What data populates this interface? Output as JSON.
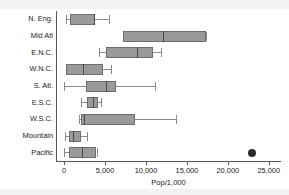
{
  "chart_data": {
    "type": "box",
    "title": "",
    "xlabel": "Pop/1,000",
    "ylabel": "",
    "xlim": [
      -1000,
      26500
    ],
    "xticks": [
      0,
      5000,
      10000,
      15000,
      20000,
      25000
    ],
    "xtick_labels": [
      "0",
      "5,000",
      "10,000",
      "15,000",
      "20,000",
      "25,000"
    ],
    "grid": false,
    "legend": "none",
    "orientation": "horizontal",
    "categories": [
      "N. Eng.",
      "Mid Atl",
      "E.N.C.",
      "W.N.C.",
      "S. Atl.",
      "E.S.C.",
      "W.S.C.",
      "Mountain",
      "Pacific"
    ],
    "boxes": [
      {
        "category": "N. Eng.",
        "whisker_low": 250,
        "q1": 700,
        "median": 3700,
        "q3": 3750,
        "whisker_high": 5450,
        "outliers": []
      },
      {
        "category": "Mid Atl",
        "whisker_low": 7200,
        "q1": 7200,
        "median": 12100,
        "q3": 17300,
        "whisker_high": 17300,
        "outliers": []
      },
      {
        "category": "E.N.C.",
        "whisker_low": 4200,
        "q1": 5100,
        "median": 8950,
        "q3": 10900,
        "whisker_high": 11850,
        "outliers": []
      },
      {
        "category": "W.N.C.",
        "whisker_low": 250,
        "q1": 250,
        "median": 2350,
        "q3": 4750,
        "whisker_high": 5700,
        "outliers": []
      },
      {
        "category": "S. Atl.",
        "whisker_low": 0,
        "q1": 2650,
        "median": 5100,
        "q3": 6300,
        "whisker_high": 11150,
        "outliers": []
      },
      {
        "category": "E.S.C.",
        "whisker_low": 2100,
        "q1": 2800,
        "median": 3500,
        "q3": 4100,
        "whisker_high": 4550,
        "outliers": []
      },
      {
        "category": "W.S.C.",
        "whisker_low": 1750,
        "q1": 2100,
        "median": 2450,
        "q3": 8600,
        "whisker_high": 13700,
        "outliers": []
      },
      {
        "category": "Mountain",
        "whisker_low": 150,
        "q1": 600,
        "median": 1050,
        "q3": 2100,
        "whisker_high": 2800,
        "outliers": []
      },
      {
        "category": "Pacific",
        "whisker_low": 0,
        "q1": 600,
        "median": 2200,
        "q3": 3950,
        "whisker_high": 3950,
        "outliers": [
          22900
        ]
      }
    ],
    "colors": {
      "box_fill": "#9a9a9a",
      "box_edge": "#6e6e6e",
      "median": "#4a4a4a",
      "whisker": "#8a8a8a",
      "outlier": "#2b2b2b",
      "axis": "#5a5a5a",
      "background": "#ffffff",
      "text": "#1a1a1a"
    }
  }
}
